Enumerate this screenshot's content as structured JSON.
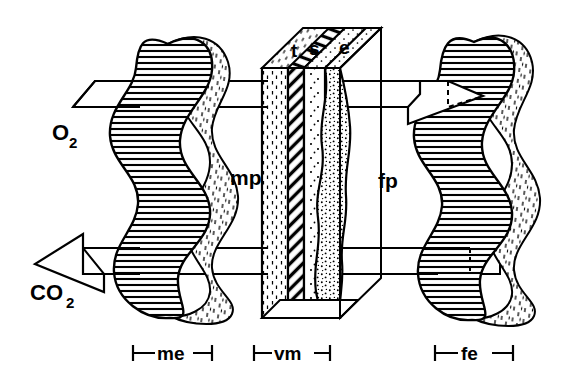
{
  "figure": {
    "type": "diagram",
    "background_color": "#ffffff",
    "line_color": "#000000",
    "width": 561,
    "height": 381
  },
  "gas_labels": {
    "inflow": {
      "base": "O",
      "sub": "2",
      "full": "O2",
      "direction": "rightward"
    },
    "outflow": {
      "base": "CO",
      "sub": "2",
      "full": "CO2",
      "direction": "leftward"
    }
  },
  "compartments": [
    {
      "key": "mp",
      "label": "mp",
      "side": "left",
      "description": "maternal placenta compartment"
    },
    {
      "key": "fp",
      "label": "fp",
      "side": "right",
      "description": "fetal placenta compartment"
    }
  ],
  "membrane_layers": [
    {
      "key": "t",
      "label": "t",
      "pattern": "dash-texture"
    },
    {
      "key": "s",
      "label": "s",
      "pattern": "diagonal-hatch"
    },
    {
      "key": "e",
      "label": "e",
      "pattern": "stipple"
    }
  ],
  "dimension_markers": [
    {
      "key": "me",
      "label": "me",
      "description": "maternal erythrocyte span"
    },
    {
      "key": "vm",
      "label": "vm",
      "description": "villous membrane span"
    },
    {
      "key": "fe",
      "label": "fe",
      "description": "fetal erythrocyte span"
    }
  ],
  "vessels": [
    {
      "key": "maternal-vessel",
      "label": "",
      "fill_pattern": "horizontal-hatch",
      "band_pattern": "dash-texture"
    },
    {
      "key": "fetal-vessel",
      "label": "",
      "fill_pattern": "horizontal-hatch",
      "band_pattern": "dash-texture"
    }
  ]
}
